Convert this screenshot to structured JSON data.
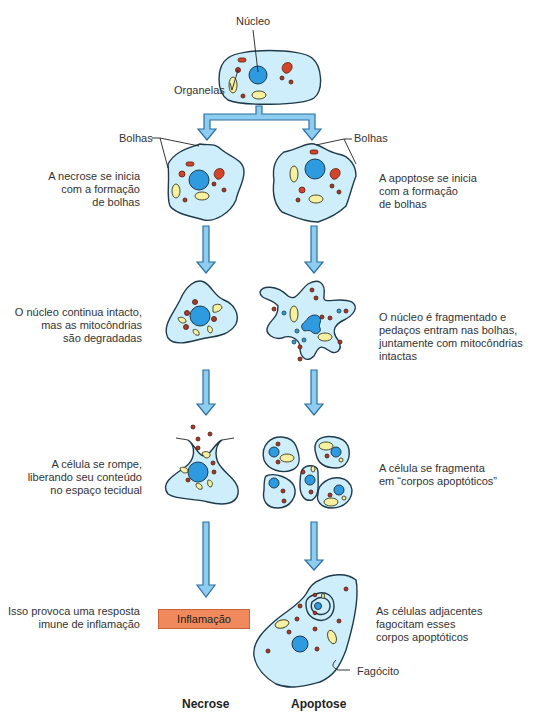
{
  "diagram": {
    "type": "flowchart",
    "colors": {
      "cell_fill": "#cdeefa",
      "cell_stroke": "#1f3a4a",
      "nucleus": "#2e9be0",
      "mitochondria_red": "#d2452a",
      "small_organelle": "#a83a2a",
      "vesicle_yellow": "#f6f0a0",
      "arrow_fill": "#8fcdf0",
      "arrow_stroke": "#2a6fa0",
      "inflammation_box": "#f08a5d"
    },
    "top": {
      "nucleus_label": "Núcleo",
      "organelles_label": "Organelas"
    },
    "necrosis": {
      "column_title": "Necrose",
      "bolhas_label": "Bolhas",
      "steps": [
        "A necrose se inicia\ncom a formação\nde bolhas",
        "O núcleo continua intacto,\nmas as mitocôndrias\nsão degradadas",
        "A célula se rompe,\nliberando seu conteúdo\nno espaço tecidual",
        "Isso provoca uma resposta\nimune de inflamação"
      ],
      "outcome_box": "Inflamação"
    },
    "apoptosis": {
      "column_title": "Apoptose",
      "bolhas_label": "Bolhas",
      "steps": [
        "A apoptose se inicia\ncom a formação\nde bolhas",
        "O núcleo é fragmentado e\npedaços entram nas bolhas,\njuntamente com mitocôndrias\nintactas",
        "A célula se fragmenta\nem “corpos apoptóticos”",
        "As células adjacentes\nfagocitam esses\ncorpos apoptóticos"
      ],
      "phagocyte_label": "Fagócito"
    }
  }
}
